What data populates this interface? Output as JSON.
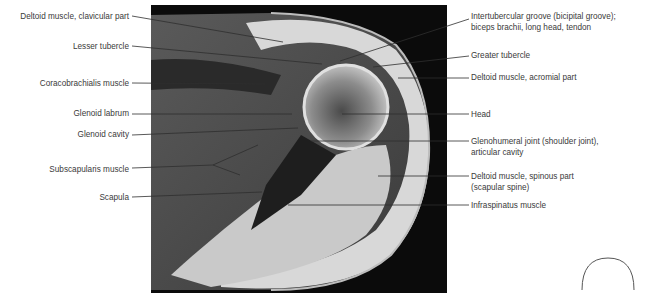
{
  "figure": {
    "type": "MRI axial section, shoulder",
    "labels_left": [
      {
        "id": "deltoid-clavicular",
        "text": "Deltoid muscle, clavicular part",
        "y": 17
      },
      {
        "id": "lesser-tubercle",
        "text": "Lesser tubercle",
        "y": 46
      },
      {
        "id": "coracobrachialis",
        "text": "Coracobrachialis muscle",
        "y": 82
      },
      {
        "id": "glenoid-labrum",
        "text": "Glenoid labrum",
        "y": 113
      },
      {
        "id": "glenoid-cavity",
        "text": "Glenoid cavity",
        "y": 134
      },
      {
        "id": "subscapularis",
        "text": "Subscapularis muscle",
        "y": 169
      },
      {
        "id": "scapula",
        "text": "Scapula",
        "y": 197
      }
    ],
    "labels_right": [
      {
        "id": "intertubercular-groove",
        "text": "Intertubercular groove (bicipital groove);",
        "text2": "biceps brachii, long head, tendon",
        "y": 17
      },
      {
        "id": "greater-tubercle",
        "text": "Greater tubercle",
        "y": 54
      },
      {
        "id": "deltoid-acromial",
        "text": "Deltoid muscle, acromial part",
        "y": 77
      },
      {
        "id": "head",
        "text": "Head",
        "y": 114
      },
      {
        "id": "glenohumeral-joint",
        "text": "Glenohumeral joint (shoulder joint),",
        "text2": "articular cavity",
        "y": 141
      },
      {
        "id": "deltoid-spinous",
        "text": "Deltoid muscle, spinous part",
        "text2": "(scapular spine)",
        "y": 175
      },
      {
        "id": "infraspinatus",
        "text": "Infraspinatus muscle",
        "y": 205
      }
    ]
  }
}
